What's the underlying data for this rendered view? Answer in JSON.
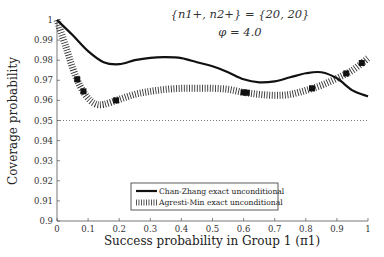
{
  "chart_data": {
    "type": "line",
    "title": "",
    "annotations": [
      "{n1+, n2+} = {20, 20}",
      "φ = 4.0"
    ],
    "xlabel": "Success probability in Group 1 (π1)",
    "ylabel": "Coverage probability",
    "xlim": [
      0,
      1
    ],
    "ylim": [
      0.9,
      1
    ],
    "xticks": [
      "0",
      "0.1",
      "0.2",
      "0.3",
      "0.4",
      "0.5",
      "0.6",
      "0.7",
      "0.8",
      "0.9",
      "1"
    ],
    "yticks": [
      "0.9",
      "0.91",
      "0.92",
      "0.93",
      "0.94",
      "0.95",
      "0.96",
      "0.97",
      "0.98",
      "0.99",
      "1"
    ],
    "grid": false,
    "reference_line": {
      "y": 0.95,
      "style": "dotted"
    },
    "legend_position": "lower center",
    "series": [
      {
        "name": "Chan-Zhang exact unconditional",
        "style": "solid",
        "x": [
          0,
          0.05,
          0.1,
          0.15,
          0.2,
          0.25,
          0.3,
          0.35,
          0.4,
          0.45,
          0.5,
          0.55,
          0.6,
          0.65,
          0.7,
          0.75,
          0.8,
          0.85,
          0.9,
          0.95,
          1
        ],
        "values": [
          1.0,
          0.9925,
          0.9845,
          0.979,
          0.978,
          0.98,
          0.9812,
          0.9815,
          0.981,
          0.979,
          0.977,
          0.974,
          0.9705,
          0.969,
          0.9695,
          0.9715,
          0.9735,
          0.974,
          0.971,
          0.965,
          0.962
        ]
      },
      {
        "name": "Agresti-Min exact unconditional",
        "style": "hatched",
        "x": [
          0,
          0.03,
          0.06,
          0.09,
          0.12,
          0.15,
          0.2,
          0.25,
          0.3,
          0.35,
          0.4,
          0.45,
          0.5,
          0.55,
          0.6,
          0.65,
          0.7,
          0.75,
          0.8,
          0.85,
          0.9,
          0.95,
          1
        ],
        "values": [
          1.0,
          0.986,
          0.972,
          0.963,
          0.9585,
          0.958,
          0.9605,
          0.963,
          0.9645,
          0.9655,
          0.966,
          0.966,
          0.966,
          0.9655,
          0.964,
          0.963,
          0.9625,
          0.963,
          0.965,
          0.9675,
          0.971,
          0.975,
          0.981
        ]
      }
    ],
    "markers_agresti_min_x": [
      0.065,
      0.085,
      0.19,
      0.6,
      0.61,
      0.82,
      0.93,
      0.98
    ]
  },
  "legend": {
    "item1": "Chan-Zhang exact unconditional",
    "item2": "Agresti-Min exact unconditional"
  },
  "annotation": {
    "line1": "{n1+, n2+} = {20, 20}",
    "line2": "φ = 4.0"
  },
  "axes": {
    "xlabel": "Success probability in Group 1 (π1)",
    "ylabel": "Coverage probability"
  }
}
